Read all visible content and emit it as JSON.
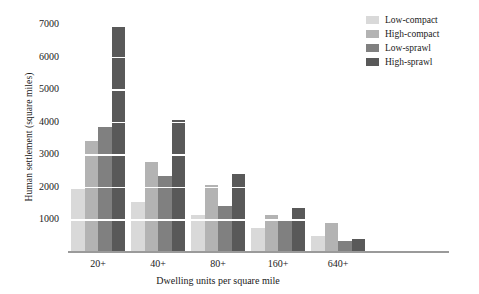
{
  "chart_data": {
    "type": "bar",
    "title": "",
    "xlabel": "Dwelling units per square mile",
    "ylabel": "Human settlement (square miles)",
    "categories": [
      "20+",
      "40+",
      "80+",
      "160+",
      "640+"
    ],
    "series": [
      {
        "name": "Low-compact",
        "color": "#d9d9d9",
        "values": [
          1950,
          1550,
          1150,
          750,
          500
        ]
      },
      {
        "name": "High-compact",
        "color": "#b3b3b3",
        "values": [
          3400,
          2750,
          2050,
          1150,
          900
        ]
      },
      {
        "name": "Low-sprawl",
        "color": "#808080",
        "values": [
          3850,
          2350,
          1400,
          950,
          350
        ]
      },
      {
        "name": "High-sprawl",
        "color": "#595959",
        "values": [
          6900,
          4050,
          2400,
          1350,
          400
        ]
      }
    ],
    "yticks": [
      1000,
      2000,
      3000,
      4000,
      5000,
      6000,
      7000
    ],
    "ylim": [
      0,
      7250
    ],
    "grid": true,
    "grid_color": "#ffffff",
    "legend_position": "top-right",
    "axis_color": "#9a9a9a",
    "background": "#ffffff"
  }
}
